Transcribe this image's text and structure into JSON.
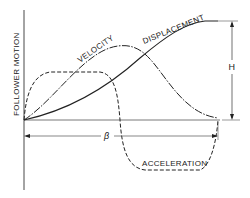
{
  "diagram": {
    "y_axis_label": "FOLLOWER MOTION",
    "curves": [
      {
        "name": "displacement",
        "label": "DISPLACEMENT",
        "style": "solid"
      },
      {
        "name": "velocity",
        "label": "VELOCITY",
        "style": "dash-dot"
      },
      {
        "name": "acceleration",
        "label": "ACCELERATION",
        "style": "dashed"
      }
    ],
    "dimensions": {
      "rise_label": "H",
      "cam_angle_label": "β"
    },
    "colors": {
      "ink": "#222222",
      "background": "#ffffff"
    }
  }
}
